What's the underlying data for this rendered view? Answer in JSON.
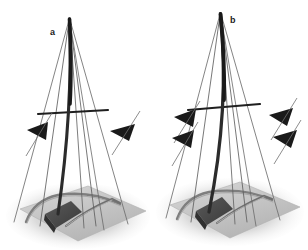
{
  "figure": {
    "type": "technical-illustration",
    "width": 308,
    "height": 250,
    "background_color": "#ffffff",
    "panels": [
      {
        "id": "a",
        "label": "a",
        "label_position": {
          "x": 50,
          "y": 28
        },
        "mast": {
          "name": "mast",
          "color": "#2b2b2b",
          "bend": "slight-forward-curve",
          "top": {
            "x": 70,
            "y": 18
          },
          "base": {
            "x": 58,
            "y": 212
          }
        },
        "spreader": {
          "name": "spreader-crossbeam",
          "color": "#1f1f1f",
          "left": {
            "x": 24,
            "y": 113
          },
          "right": {
            "x": 111,
            "y": 110
          }
        },
        "stays": [
          {
            "name": "forestay",
            "color": "#555555"
          },
          {
            "name": "backstay",
            "color": "#555555"
          },
          {
            "name": "port-shroud",
            "color": "#666666"
          },
          {
            "name": "starboard-shroud",
            "color": "#666666"
          },
          {
            "name": "lower-shroud-left",
            "color": "#6a6a6a"
          },
          {
            "name": "lower-shroud-right",
            "color": "#6a6a6a"
          }
        ],
        "force_markers": [
          {
            "name": "force-arrow-left",
            "direction": "left",
            "x": 38,
            "y": 130,
            "size": 18,
            "color": "#1a1a1a"
          },
          {
            "name": "force-arrow-right",
            "direction": "left",
            "x": 122,
            "y": 131,
            "size": 17,
            "color": "#1a1a1a"
          }
        ],
        "hull": {
          "name": "hull-deck",
          "platform_color": "#c9c9c9",
          "shadow_color": "#d6d6d6",
          "block_color": "#4a4a4a",
          "rail_color": "#8d8d8d"
        }
      },
      {
        "id": "b",
        "label": "b",
        "label_position": {
          "x": 230,
          "y": 16
        },
        "mast": {
          "name": "mast",
          "color": "#2b2b2b",
          "bend": "strong-forward-curve",
          "top": {
            "x": 66,
            "y": 12
          },
          "base": {
            "x": 56,
            "y": 210
          }
        },
        "spreader": {
          "name": "spreader-crossbeam",
          "color": "#1f1f1f",
          "left": {
            "x": 22,
            "y": 108
          },
          "right": {
            "x": 108,
            "y": 104
          }
        },
        "stays": [
          {
            "name": "forestay",
            "color": "#555555"
          },
          {
            "name": "backstay",
            "color": "#555555"
          },
          {
            "name": "port-shroud",
            "color": "#666666"
          },
          {
            "name": "starboard-shroud",
            "color": "#666666"
          },
          {
            "name": "lower-shroud-left",
            "color": "#6a6a6a"
          },
          {
            "name": "lower-shroud-right",
            "color": "#6a6a6a"
          }
        ],
        "force_markers": [
          {
            "name": "force-arrow-upper-left",
            "direction": "left",
            "x": 28,
            "y": 118,
            "size": 17,
            "color": "#1a1a1a"
          },
          {
            "name": "force-arrow-lower-left",
            "direction": "left",
            "x": 25,
            "y": 138,
            "size": 17,
            "color": "#1a1a1a"
          },
          {
            "name": "force-arrow-upper-right",
            "direction": "left",
            "x": 120,
            "y": 116,
            "size": 17,
            "color": "#1a1a1a"
          },
          {
            "name": "force-arrow-lower-right",
            "direction": "left",
            "x": 125,
            "y": 138,
            "size": 17,
            "color": "#1a1a1a"
          }
        ],
        "hull": {
          "name": "hull-deck",
          "platform_color": "#c9c9c9",
          "shadow_color": "#d6d6d6",
          "block_color": "#4a4a4a",
          "rail_color": "#8d8d8d"
        }
      }
    ]
  }
}
